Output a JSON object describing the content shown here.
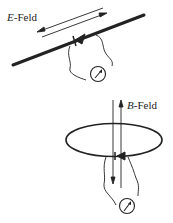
{
  "diagram": {
    "top": {
      "field_label_symbol": "E",
      "field_label_suffix": "-Feld",
      "description": "Rod antenna with diode and meter, E-field arrows parallel to rod"
    },
    "bottom": {
      "field_label_symbol": "B",
      "field_label_suffix": "-Feld",
      "description": "Loop antenna with diode and meter, B-field arrows perpendicular through loop"
    },
    "colors": {
      "ink": "#222222",
      "background": "#ffffff"
    },
    "icons": [
      "diode-icon",
      "meter-icon",
      "arrow-icon"
    ]
  }
}
